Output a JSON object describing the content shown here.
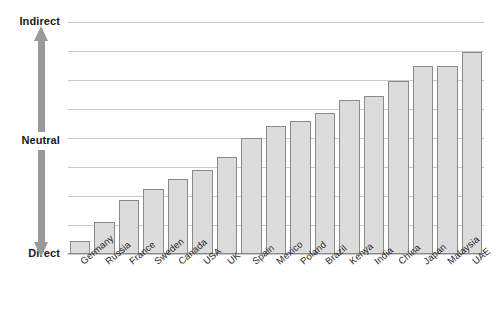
{
  "chart_data": {
    "type": "bar",
    "title": "",
    "subtitle": "",
    "xlabel": "",
    "ylabel": "",
    "grid": true,
    "legend": false,
    "orientation": "vertical",
    "axis_scale_labels": {
      "top": "Indirect",
      "middle": "Neutral",
      "bottom": "Direct"
    },
    "ylim": [
      0,
      8
    ],
    "y_gridline_count": 9,
    "neutral_level": 4,
    "categories": [
      "Germany",
      "Russia",
      "France",
      "Sweden",
      "Canada",
      "USA",
      "UK",
      "Spain",
      "Mexico",
      "Poland",
      "Brazil",
      "Kenya",
      "India",
      "China",
      "Japan",
      "Malaysia",
      "UAE"
    ],
    "values": [
      0.45,
      1.1,
      1.85,
      2.25,
      2.6,
      2.9,
      3.35,
      4.0,
      4.4,
      4.6,
      4.85,
      5.3,
      5.45,
      5.95,
      6.5,
      6.5,
      6.95
    ],
    "bar_fill_color": "#dcdcdc",
    "bar_border_color": "#8a8a8a",
    "gridline_color": "#c9c9c9",
    "arrow_color": "#9a9a9a",
    "background_color": "#ffffff"
  },
  "axis": {
    "indirect_label": "Indirect",
    "neutral_label": "Neutral",
    "direct_label": "Direct"
  }
}
